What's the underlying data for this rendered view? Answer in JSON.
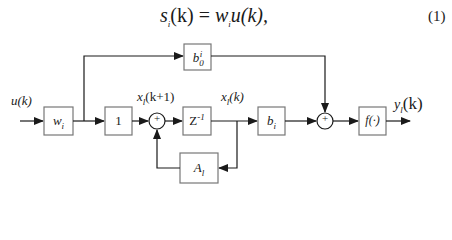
{
  "equation": {
    "text": "s_i(k) = w_i u(k),",
    "lhs": "s",
    "lhs_sub": "i",
    "lhs_arg": "(k)",
    "eq": " = ",
    "rhs_w": "w",
    "rhs_w_sub": "i",
    "rhs_u": "u(k),",
    "number": "(1)"
  },
  "diagram": {
    "input_label": "u(k)",
    "blocks": {
      "w": {
        "main": "w",
        "sub": "i"
      },
      "one": {
        "main": "1"
      },
      "z": {
        "main": "Z",
        "sup": "-1"
      },
      "b": {
        "main": "b",
        "sub": "i"
      },
      "b0": {
        "main": "b",
        "sub": "0",
        "sup": "i"
      },
      "f": {
        "main": "f(·)"
      },
      "A": {
        "main": "A",
        "sub": "l"
      }
    },
    "sum_symbol": "+",
    "signal_labels": {
      "x_next": {
        "main": "x",
        "sub": "l",
        "arg": "(k+1)"
      },
      "x_curr": {
        "main": "x",
        "sub": "l",
        "arg": "(k)"
      },
      "y_out": {
        "main": "y",
        "sub": "l",
        "arg": "(k)"
      }
    }
  }
}
